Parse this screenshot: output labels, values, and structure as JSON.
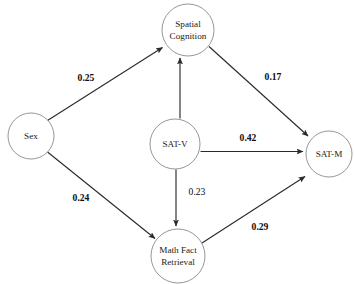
{
  "diagram": {
    "type": "path-diagram",
    "title": "",
    "background_color": "#ffffff",
    "node_stroke_color": "#8a8a8a",
    "edge_color": "#2b2b2b",
    "label_color": "#0d0d0d",
    "nodes": [
      {
        "id": "spatial-cognition",
        "lines": [
          "Spatial",
          "Cognition"
        ],
        "line1": "Spatial",
        "line2": "Cognition",
        "cx": 188,
        "cy": 30,
        "r": 26
      },
      {
        "id": "sex",
        "lines": [
          "Sex"
        ],
        "line1": "Sex",
        "line2": "",
        "cx": 31,
        "cy": 136,
        "r": 23
      },
      {
        "id": "sat-v",
        "lines": [
          "SAT-V"
        ],
        "line1": "SAT-V",
        "line2": "",
        "cx": 175,
        "cy": 144,
        "r": 25
      },
      {
        "id": "sat-m",
        "lines": [
          "SAT-M"
        ],
        "line1": "SAT-M",
        "line2": "",
        "cx": 329,
        "cy": 154,
        "r": 23
      },
      {
        "id": "math-fact-retrieval",
        "lines": [
          "Math Fact",
          "Retrieval"
        ],
        "line1": "Math Fact",
        "line2": "Retrieval",
        "cx": 178,
        "cy": 256,
        "r": 27
      }
    ],
    "edges": [
      {
        "id": "sex-to-spatial",
        "from": "sex",
        "to": "spatial-cognition",
        "coefficient": "0.25",
        "bold": true,
        "label_x": 86,
        "label_y": 79
      },
      {
        "id": "sex-to-math-fact",
        "from": "sex",
        "to": "math-fact-retrieval",
        "coefficient": "0.24",
        "bold": true,
        "label_x": 81,
        "label_y": 199
      },
      {
        "id": "spatial-to-sat-m",
        "from": "spatial-cognition",
        "to": "sat-m",
        "coefficient": "0.17",
        "bold": true,
        "label_x": 273,
        "label_y": 78
      },
      {
        "id": "sat-v-to-spatial",
        "from": "sat-v",
        "to": "spatial-cognition",
        "coefficient": "",
        "bold": false,
        "label_x": 0,
        "label_y": 0
      },
      {
        "id": "sat-v-to-sat-m",
        "from": "sat-v",
        "to": "sat-m",
        "coefficient": "0.42",
        "bold": true,
        "label_x": 248,
        "label_y": 139
      },
      {
        "id": "sat-v-to-math-fact",
        "from": "sat-v",
        "to": "math-fact-retrieval",
        "coefficient": "0.23",
        "bold": false,
        "label_x": 197,
        "label_y": 193
      },
      {
        "id": "math-fact-to-sat-m",
        "from": "math-fact-retrieval",
        "to": "sat-m",
        "coefficient": "0.29",
        "bold": true,
        "label_x": 260,
        "label_y": 228
      }
    ]
  }
}
